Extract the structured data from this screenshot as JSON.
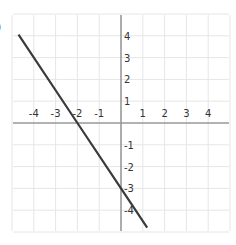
{
  "label": ")",
  "colors": {
    "grid": "#e6e6e6",
    "axis": "#999999",
    "line": "#3a3a3a",
    "text": "#333333"
  },
  "chart_data": {
    "type": "line",
    "title": "",
    "xlabel": "",
    "ylabel": "",
    "xlim": [
      -5,
      5
    ],
    "ylim": [
      -5,
      5
    ],
    "grid": true,
    "x_tick_labels": [
      "-4",
      "-3",
      "-2",
      "-1",
      "1",
      "2",
      "3",
      "4"
    ],
    "y_tick_labels": [
      "4",
      "3",
      "2",
      "1",
      "-1",
      "-2",
      "-3",
      "-4"
    ],
    "series": [
      {
        "name": "line",
        "equation": "y = -1.5x - 3",
        "x": [
          -4.7,
          -2,
          0,
          1.2
        ],
        "y": [
          4.05,
          0,
          -3,
          -4.8
        ]
      }
    ]
  }
}
